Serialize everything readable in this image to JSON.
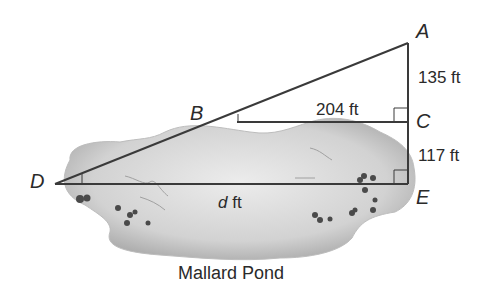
{
  "diagram": {
    "points": {
      "A": {
        "label": "A",
        "x": 408,
        "y": 43
      },
      "B": {
        "label": "B",
        "x": 237,
        "y": 122
      },
      "C": {
        "label": "C",
        "x": 408,
        "y": 122
      },
      "D": {
        "label": "D",
        "x": 55,
        "y": 184
      },
      "E": {
        "label": "E",
        "x": 408,
        "y": 184
      }
    },
    "measurements": {
      "AC": "135 ft",
      "BC": "204 ft",
      "CE": "117 ft",
      "DE_var": "d",
      "DE_unit": " ft"
    },
    "caption": "Mallard Pond",
    "colors": {
      "line": "#3a3a3a",
      "pond_light": "#e6e6e6",
      "pond_dark": "#b8b8b8",
      "text": "#2a2a2a"
    }
  }
}
